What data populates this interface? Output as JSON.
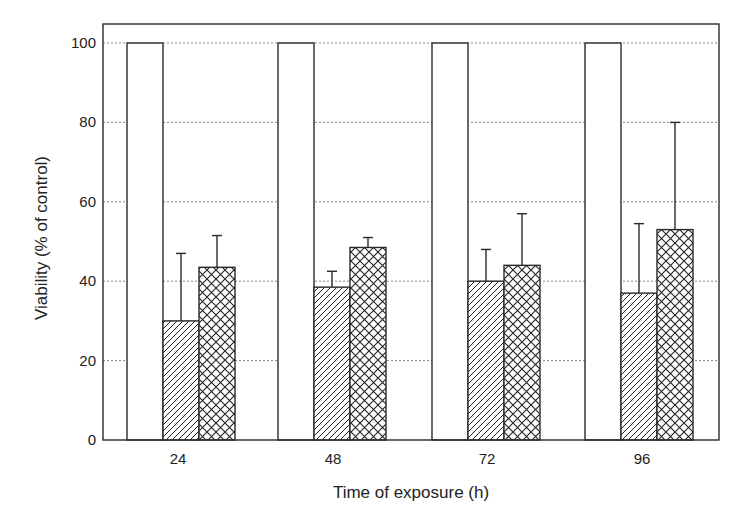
{
  "chart_data": {
    "type": "bar",
    "title": "",
    "xlabel": "Time of exposure (h)",
    "ylabel": "Viability (% of control)",
    "ylim": [
      0,
      100
    ],
    "yticks": [
      0,
      20,
      40,
      60,
      80,
      100
    ],
    "grid": "horizontal dotted",
    "legend": null,
    "categories": [
      "24",
      "48",
      "72",
      "96"
    ],
    "series": [
      {
        "name": "Control",
        "pattern": "white",
        "values": [
          100,
          100,
          100,
          100
        ],
        "error": [
          0,
          0,
          0,
          0
        ]
      },
      {
        "name": "Treatment A",
        "pattern": "diagonal-hatch",
        "values": [
          30,
          38.5,
          40,
          37
        ],
        "error": [
          17,
          4,
          8,
          17.5
        ]
      },
      {
        "name": "Treatment B",
        "pattern": "cross-hatch",
        "values": [
          43.5,
          48.5,
          44,
          53
        ],
        "error": [
          8,
          2.5,
          13,
          27
        ]
      }
    ]
  },
  "colors": {
    "stroke": "#2a2a2a",
    "grid": "#888888",
    "background": "#ffffff"
  }
}
